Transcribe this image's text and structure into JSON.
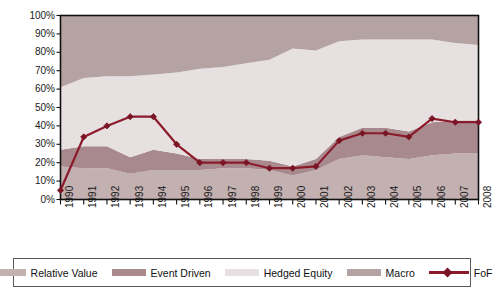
{
  "chart_data": {
    "type": "area",
    "title": "",
    "subtitle": "",
    "xlabel": "",
    "ylabel": "",
    "stacked": true,
    "grid": false,
    "legend_position": "bottom",
    "ylim": [
      0,
      100
    ],
    "ytick_labels": [
      "100%",
      "90%",
      "80%",
      "70%",
      "60%",
      "50%",
      "40%",
      "30%",
      "20%",
      "10%",
      "0%"
    ],
    "ytick_values": [
      100,
      90,
      80,
      70,
      60,
      50,
      40,
      30,
      20,
      10,
      0
    ],
    "categories": [
      "1990",
      "1991",
      "1992",
      "1993",
      "1994",
      "1995",
      "1996",
      "1997",
      "1998",
      "1999",
      "2000",
      "2001",
      "2002",
      "2003",
      "2004",
      "2005",
      "2006",
      "2007",
      "2008"
    ],
    "x": [
      1990,
      1991,
      1992,
      1993,
      1994,
      1995,
      1996,
      1997,
      1998,
      1999,
      2000,
      2001,
      2002,
      2003,
      2004,
      2005,
      2006,
      2007,
      2008
    ],
    "series": [
      {
        "name": "Relative Value",
        "color": "#c3b0b0",
        "kind": "area",
        "values": [
          18,
          17,
          17,
          14,
          16,
          16,
          16,
          17,
          17,
          16,
          13,
          16,
          22,
          24,
          23,
          22,
          24,
          25,
          25
        ]
      },
      {
        "name": "Event Driven",
        "color": "#a88a8e",
        "kind": "area",
        "values": [
          9,
          12,
          12,
          9,
          11,
          9,
          6,
          5,
          5,
          5,
          5,
          6,
          12,
          15,
          16,
          15,
          18,
          18,
          18
        ]
      },
      {
        "name": "Hedged Equity",
        "color": "#e6e0e0",
        "kind": "area",
        "values": [
          34,
          37,
          38,
          44,
          41,
          44,
          49,
          50,
          52,
          55,
          64,
          59,
          52,
          48,
          48,
          50,
          45,
          42,
          41
        ]
      },
      {
        "name": "Macro",
        "color": "#b5a3a3",
        "kind": "area",
        "values": [
          39,
          34,
          33,
          33,
          32,
          31,
          29,
          28,
          26,
          24,
          18,
          19,
          14,
          13,
          13,
          13,
          13,
          15,
          16
        ]
      },
      {
        "name": "FoF",
        "color": "#8b1a2b",
        "kind": "line",
        "marker": "diamond",
        "values": [
          5,
          34,
          40,
          45,
          45,
          30,
          20,
          20,
          20,
          17,
          17,
          18,
          32,
          36,
          36,
          34,
          44,
          42,
          42
        ]
      }
    ]
  },
  "legend": {
    "items": [
      {
        "label": "Relative Value",
        "type": "swatch",
        "color": "#c3b0b0"
      },
      {
        "label": "Event Driven",
        "type": "swatch",
        "color": "#a88a8e"
      },
      {
        "label": "Hedged Equity",
        "type": "swatch",
        "color": "#e6e0e0"
      },
      {
        "label": "Macro",
        "type": "swatch",
        "color": "#b5a3a3"
      },
      {
        "label": "FoF",
        "type": "line",
        "color": "#8b1a2b"
      }
    ]
  },
  "axes": {
    "frame_color": "#111111",
    "background": "#ffffff"
  }
}
